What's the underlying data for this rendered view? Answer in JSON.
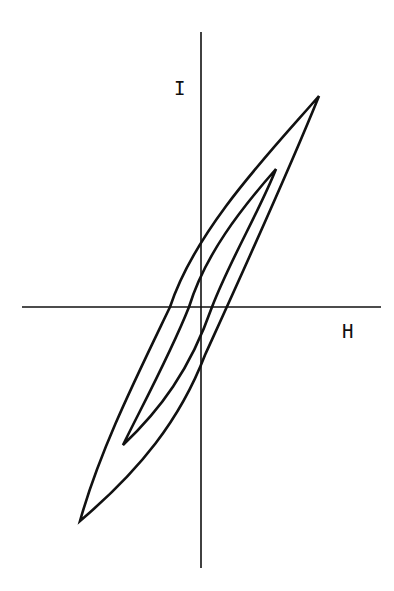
{
  "diagram": {
    "type": "hysteresis-loops",
    "axes": {
      "y_label": "I",
      "x_label": "H"
    },
    "loops": [
      {
        "name": "outer-loop"
      },
      {
        "name": "inner-loop"
      }
    ],
    "stroke_color": "#111111",
    "background": "#ffffff"
  }
}
